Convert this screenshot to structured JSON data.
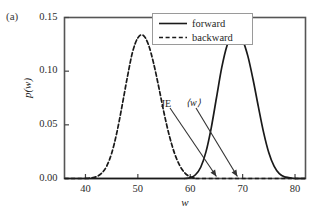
{
  "panel": {
    "label": "(a)"
  },
  "axes": {
    "xlabel": "w",
    "ylabel": "p(w)",
    "xticks": [
      "40",
      "50",
      "60",
      "70",
      "80"
    ],
    "yticks": [
      "0.00",
      "0.05",
      "0.10",
      "0.15"
    ],
    "xlim": [
      36,
      82
    ],
    "ylim": [
      0.0,
      0.15
    ]
  },
  "legend": {
    "entries": [
      {
        "label": "forward",
        "style": "solid",
        "color": "#1a1a1a"
      },
      {
        "label": "backward",
        "style": "dashed",
        "color": "#1a1a1a"
      }
    ]
  },
  "annotations": [
    {
      "name": "je",
      "text": "JE",
      "target_x": 65.0
    },
    {
      "name": "avg-w",
      "text": "⟨w⟩",
      "target_x": 69.0
    }
  ],
  "chart_data": {
    "type": "line",
    "title": "",
    "xlabel": "w",
    "ylabel": "p(w)",
    "xlim": [
      36,
      82
    ],
    "ylim": [
      0.0,
      0.15
    ],
    "xticks": [
      40,
      50,
      60,
      70,
      80
    ],
    "yticks": [
      0.0,
      0.05,
      0.1,
      0.15
    ],
    "grid": false,
    "legend_position": "upper right",
    "annotations": [
      {
        "text": "JE",
        "x": 61.0,
        "y": 0.062,
        "arrow_to_x": 65.0,
        "arrow_to_y": 0.0
      },
      {
        "text": "⟨w⟩",
        "x": 64.5,
        "y": 0.062,
        "arrow_to_x": 69.0,
        "arrow_to_y": 0.0
      }
    ],
    "series": [
      {
        "name": "forward",
        "style": "solid",
        "mean": 69.0,
        "peak_value": 0.1355,
        "x": [
          59.0,
          60.0,
          61.0,
          62.0,
          63.0,
          64.0,
          65.0,
          66.0,
          67.0,
          68.0,
          69.0,
          70.0,
          71.0,
          72.0,
          73.0,
          74.0,
          75.0,
          76.0,
          77.0,
          78.0,
          80.0
        ],
        "y": [
          0.0,
          0.0008,
          0.0035,
          0.0105,
          0.0248,
          0.047,
          0.075,
          0.103,
          0.1235,
          0.134,
          0.1355,
          0.129,
          0.114,
          0.092,
          0.067,
          0.043,
          0.024,
          0.0115,
          0.0045,
          0.0015,
          0.0
        ]
      },
      {
        "name": "backward",
        "style": "dashed",
        "mean": 51.0,
        "peak_value": 0.1335,
        "x": [
          40.0,
          41.0,
          42.0,
          43.0,
          44.0,
          45.0,
          46.0,
          47.0,
          48.0,
          49.0,
          50.0,
          51.0,
          52.0,
          53.0,
          54.0,
          55.0,
          56.0,
          57.0,
          58.0,
          59.0,
          60.0,
          61.0
        ],
        "y": [
          0.0,
          0.0005,
          0.0015,
          0.0045,
          0.011,
          0.0235,
          0.043,
          0.068,
          0.0945,
          0.118,
          0.131,
          0.1335,
          0.125,
          0.1075,
          0.085,
          0.061,
          0.04,
          0.0235,
          0.012,
          0.005,
          0.0015,
          0.0
        ]
      }
    ]
  }
}
